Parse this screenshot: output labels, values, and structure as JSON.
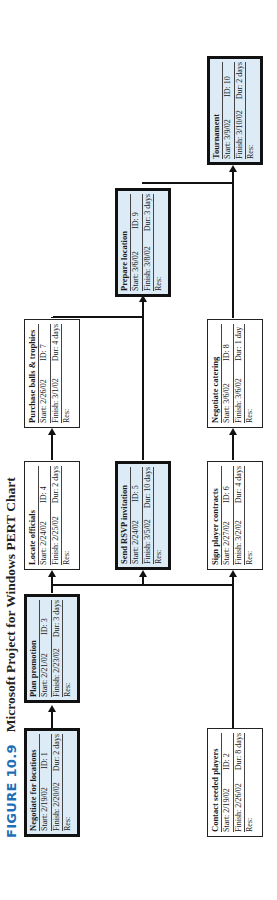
{
  "caption": {
    "figure_number": "FIGURE 10.9",
    "title": "Microsoft Project for Windows PERT Chart"
  },
  "colors": {
    "figure_number": "#1e6fb8",
    "critical_fill": "#dcebf5",
    "normal_fill": "#ffffff",
    "line": "#111111"
  },
  "nodes": [
    {
      "id": "1",
      "name": "Negotiate for locations",
      "start": "Start:  2/19/02",
      "id_label": "ID:  1",
      "finish": "Finish: 2/20/02",
      "dur": "Dur: 2 days",
      "res": "Res:",
      "critical": true
    },
    {
      "id": "2",
      "name": "Contact seeded players",
      "start": "Start:  2/19/02",
      "id_label": "ID:  2",
      "finish": "Finish: 2/26/02",
      "dur": "Dur: 8 days",
      "res": "Res:",
      "critical": false
    },
    {
      "id": "3",
      "name": "Plan promotion",
      "start": "Start:  2/21/02",
      "id_label": "ID:  3",
      "finish": "Finish: 2/23/02",
      "dur": "Dur: 3 days",
      "res": "Res:",
      "critical": true
    },
    {
      "id": "4",
      "name": "Locate officials",
      "start": "Start:  2/24/02",
      "id_label": "ID:  4",
      "finish": "Finish: 2/25/02",
      "dur": "Dur: 2 days",
      "res": "Res:",
      "critical": false
    },
    {
      "id": "5",
      "name": "Send RSVP invitation",
      "start": "Start:  2/24/02",
      "id_label": "ID:  5",
      "finish": "Finish: 3/5/02",
      "dur": "Dur: 10 days",
      "res": "Res:",
      "critical": true
    },
    {
      "id": "6",
      "name": "Sign player contracts",
      "start": "Start:  2/27/02",
      "id_label": "ID:  6",
      "finish": "Finish: 3/2/02",
      "dur": "Dur: 4 days",
      "res": "Res:",
      "critical": false
    },
    {
      "id": "7",
      "name": "Purchase balls & trophies",
      "start": "Start:  2/26/02",
      "id_label": "ID:  7",
      "finish": "Finish: 3/1/02",
      "dur": "Dur: 4 days",
      "res": "Res:",
      "critical": false
    },
    {
      "id": "8",
      "name": "Negotiate catering",
      "start": "Start:  3/6/02",
      "id_label": "ID:  8",
      "finish": "Finish: 3/6/02",
      "dur": "Dur: 1 day",
      "res": "Res:",
      "critical": false
    },
    {
      "id": "9",
      "name": "Prepare location",
      "start": "Start:  3/6/02",
      "id_label": "ID:  9",
      "finish": "Finish: 3/8/02",
      "dur": "Dur: 3 days",
      "res": "Res:",
      "critical": true
    },
    {
      "id": "10",
      "name": "Tournament",
      "start": "Start:  3/9/02",
      "id_label": "ID:  10",
      "finish": "Finish: 3/10/02",
      "dur": "Dur: 2 days",
      "res": "Res:",
      "critical": true
    }
  ],
  "dependencies": [
    [
      "1",
      "3"
    ],
    [
      "3",
      "4"
    ],
    [
      "3",
      "5"
    ],
    [
      "3",
      "6"
    ],
    [
      "2",
      "6"
    ],
    [
      "4",
      "7"
    ],
    [
      "5",
      "9"
    ],
    [
      "7",
      "9"
    ],
    [
      "6",
      "8"
    ],
    [
      "9",
      "10"
    ],
    [
      "8",
      "10"
    ]
  ]
}
